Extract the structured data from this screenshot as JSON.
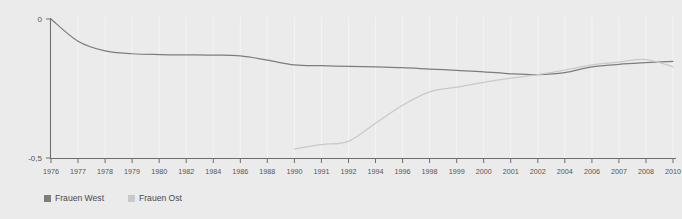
{
  "chart_data": {
    "type": "line",
    "title": "",
    "subtitle": "",
    "xlabel": "",
    "ylabel": "",
    "grid": true,
    "legend_position": "bottom-left",
    "background_color": "#ebebeb",
    "axis_color": "#6e6e6e",
    "ylim": [
      -0.5,
      0.0
    ],
    "yticks": [
      0,
      -0.5
    ],
    "ytick_labels": [
      "0",
      "-0,5"
    ],
    "xlim": [
      1976,
      2010
    ],
    "xtick_labels": [
      "1976",
      "1977",
      "1978",
      "1979",
      "1980",
      "1982",
      "1984",
      "1986",
      "1988",
      "1990",
      "1991",
      "1992",
      "1994",
      "1996",
      "1998",
      "1999",
      "2000",
      "2001",
      "2002",
      "2004",
      "2006",
      "2007",
      "2008",
      "2010"
    ],
    "xticks": [
      1976,
      1977,
      1978,
      1979,
      1980,
      1982,
      1984,
      1986,
      1988,
      1990,
      1991,
      1992,
      1994,
      1996,
      1998,
      1999,
      2000,
      2001,
      2002,
      2004,
      2006,
      2007,
      2008,
      2010
    ],
    "series": [
      {
        "name": "Frauen West",
        "color": "#7d7d7d",
        "x": [
          1976,
          1977,
          1978,
          1979,
          1980,
          1982,
          1984,
          1986,
          1988,
          1990,
          1991,
          1992,
          1994,
          1996,
          1998,
          1999,
          2000,
          2001,
          2002,
          2004,
          2006,
          2007,
          2008,
          2010
        ],
        "values": [
          0.0,
          -0.08,
          -0.115,
          -0.125,
          -0.128,
          -0.129,
          -0.13,
          -0.133,
          -0.148,
          -0.165,
          -0.168,
          -0.17,
          -0.172,
          -0.175,
          -0.18,
          -0.185,
          -0.19,
          -0.197,
          -0.2,
          -0.193,
          -0.172,
          -0.163,
          -0.157,
          -0.152
        ]
      },
      {
        "name": "Frauen Ost",
        "color": "#c9c9c9",
        "x": [
          1990,
          1991,
          1992,
          1994,
          1996,
          1998,
          1999,
          2000,
          2001,
          2002,
          2004,
          2006,
          2007,
          2008,
          2010
        ],
        "values": [
          -0.468,
          -0.452,
          -0.44,
          -0.375,
          -0.31,
          -0.262,
          -0.245,
          -0.228,
          -0.213,
          -0.2,
          -0.184,
          -0.165,
          -0.155,
          -0.146,
          -0.172
        ]
      }
    ]
  },
  "legend": {
    "items": [
      {
        "label": "Frauen West",
        "color": "#7d7d7d"
      },
      {
        "label": "Frauen Ost",
        "color": "#c9c9c9"
      }
    ]
  }
}
